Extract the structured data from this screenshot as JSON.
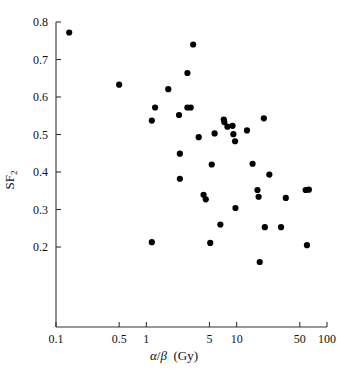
{
  "figure": {
    "title": "",
    "background": "#ffffff",
    "marker_color": "#000000",
    "axis_color": "#333333"
  },
  "axes": {
    "x_label_alpha": "α",
    "x_label_slash": "/",
    "x_label_beta": "β",
    "x_label_units": "(Gy)",
    "x_label_full": "α/β  (Gy)",
    "y_label_main": "SF",
    "y_label_sub": "2",
    "y_label_full": "SF2"
  },
  "chart_data": {
    "type": "scatter",
    "title": "",
    "xlabel": "α/β  (Gy)",
    "ylabel": "SF2",
    "xscale": "log",
    "yscale": "linear",
    "xlim": [
      0.1,
      100
    ],
    "ylim": [
      0.1,
      0.82
    ],
    "xticks": [
      0.1,
      0.5,
      1,
      5,
      10,
      50,
      100
    ],
    "xtick_labels": [
      "0.1",
      "0.5",
      "1",
      "5",
      "10",
      "50",
      "100"
    ],
    "yticks": [
      0.2,
      0.3,
      0.4,
      0.5,
      0.6,
      0.7,
      0.8
    ],
    "ytick_labels": [
      "0.2",
      "0.3",
      "0.4",
      "0.5",
      "0.6",
      "0.7",
      "0.8"
    ],
    "grid": false,
    "legend": false,
    "marker": "filled-circle",
    "n_points": 47,
    "points": [
      {
        "x": 0.14,
        "y": 0.772
      },
      {
        "x": 0.5,
        "y": 0.633
      },
      {
        "x": 1.15,
        "y": 0.537
      },
      {
        "x": 1.25,
        "y": 0.572
      },
      {
        "x": 1.15,
        "y": 0.213
      },
      {
        "x": 1.75,
        "y": 0.621
      },
      {
        "x": 2.3,
        "y": 0.552
      },
      {
        "x": 2.35,
        "y": 0.449
      },
      {
        "x": 2.35,
        "y": 0.382
      },
      {
        "x": 2.85,
        "y": 0.664
      },
      {
        "x": 2.85,
        "y": 0.572
      },
      {
        "x": 3.1,
        "y": 0.572
      },
      {
        "x": 3.3,
        "y": 0.74
      },
      {
        "x": 3.8,
        "y": 0.493
      },
      {
        "x": 4.3,
        "y": 0.339
      },
      {
        "x": 4.55,
        "y": 0.327
      },
      {
        "x": 5.1,
        "y": 0.211
      },
      {
        "x": 5.3,
        "y": 0.42
      },
      {
        "x": 5.7,
        "y": 0.503
      },
      {
        "x": 6.6,
        "y": 0.26
      },
      {
        "x": 7.2,
        "y": 0.54
      },
      {
        "x": 7.3,
        "y": 0.533
      },
      {
        "x": 7.9,
        "y": 0.521
      },
      {
        "x": 9.0,
        "y": 0.523
      },
      {
        "x": 9.2,
        "y": 0.501
      },
      {
        "x": 9.6,
        "y": 0.482
      },
      {
        "x": 9.7,
        "y": 0.304
      },
      {
        "x": 13.0,
        "y": 0.511
      },
      {
        "x": 15.0,
        "y": 0.422
      },
      {
        "x": 17.0,
        "y": 0.352
      },
      {
        "x": 17.5,
        "y": 0.334
      },
      {
        "x": 18.0,
        "y": 0.16
      },
      {
        "x": 20.0,
        "y": 0.543
      },
      {
        "x": 20.5,
        "y": 0.253
      },
      {
        "x": 23.0,
        "y": 0.393
      },
      {
        "x": 31.0,
        "y": 0.253
      },
      {
        "x": 35.0,
        "y": 0.331
      },
      {
        "x": 58.0,
        "y": 0.352
      },
      {
        "x": 63.0,
        "y": 0.353
      },
      {
        "x": 60.0,
        "y": 0.205
      }
    ]
  }
}
